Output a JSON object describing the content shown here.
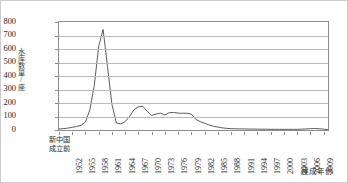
{
  "chart_data": {
    "type": "line",
    "title": "",
    "xlabel": "建成年份",
    "ylabel": "水库数量/座",
    "ylim": [
      0,
      800
    ],
    "ytick_values": [
      0,
      100,
      200,
      300,
      400,
      500,
      600,
      700,
      800
    ],
    "ytick_labels": [
      "0",
      "100",
      "200",
      "300",
      "400",
      "500",
      "600",
      "700",
      "800"
    ],
    "grid": true,
    "legend": "none",
    "xtick_labels": [
      "新中国成立前",
      "1952",
      "1955",
      "1958",
      "1961",
      "1964",
      "1967",
      "1970",
      "1973",
      "1976",
      "1979",
      "1982",
      "1985",
      "1988",
      "1991",
      "1994",
      "1997",
      "2000",
      "2003",
      "2006",
      "2009"
    ],
    "categories": [
      "新中国成立前",
      "1950",
      "1951",
      "1952",
      "1953",
      "1954",
      "1955",
      "1956",
      "1957",
      "1958",
      "1959",
      "1960",
      "1961",
      "1962",
      "1963",
      "1964",
      "1965",
      "1966",
      "1967",
      "1968",
      "1969",
      "1970",
      "1971",
      "1972",
      "1973",
      "1974",
      "1975",
      "1976",
      "1977",
      "1978",
      "1979",
      "1980",
      "1981",
      "1982",
      "1983",
      "1984",
      "1985",
      "1986",
      "1987",
      "1988",
      "1989",
      "1990",
      "1991",
      "1992",
      "1993",
      "1994",
      "1995",
      "1996",
      "1997",
      "1998",
      "1999",
      "2000",
      "2001",
      "2002",
      "2003",
      "2004",
      "2005",
      "2006",
      "2007",
      "2008",
      "2009",
      "2010"
    ],
    "values": [
      8,
      10,
      14,
      20,
      26,
      34,
      60,
      150,
      330,
      620,
      745,
      470,
      190,
      52,
      45,
      62,
      100,
      150,
      172,
      175,
      140,
      108,
      118,
      125,
      112,
      128,
      130,
      125,
      124,
      124,
      118,
      80,
      62,
      50,
      38,
      28,
      22,
      16,
      12,
      10,
      9,
      8,
      8,
      7,
      7,
      6,
      6,
      6,
      5,
      5,
      5,
      5,
      5,
      5,
      5,
      6,
      8,
      10,
      11,
      9,
      6,
      2
    ],
    "peak": {
      "year": "1959",
      "value": 745
    },
    "secondary_peak": {
      "year": "1968",
      "value": 175
    }
  }
}
